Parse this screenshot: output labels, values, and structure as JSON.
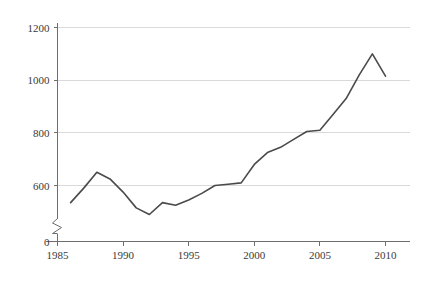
{
  "chart_data": {
    "type": "line",
    "title": "",
    "subtitle": "",
    "xlabel": "",
    "ylabel": "",
    "x": [
      1986,
      1987,
      1988,
      1989,
      1990,
      1991,
      1992,
      1993,
      1994,
      1995,
      1996,
      1997,
      1998,
      1999,
      2000,
      2001,
      2002,
      2003,
      2004,
      2005,
      2006,
      2007,
      2008,
      2009,
      2010
    ],
    "values": [
      535,
      590,
      650,
      625,
      575,
      515,
      490,
      535,
      525,
      545,
      570,
      600,
      605,
      610,
      680,
      725,
      745,
      775,
      805,
      810,
      870,
      930,
      1020,
      1100,
      1015
    ],
    "series": [
      {
        "name": "series-1",
        "values": [
          535,
          590,
          650,
          625,
          575,
          515,
          490,
          535,
          525,
          545,
          570,
          600,
          605,
          610,
          680,
          725,
          745,
          775,
          805,
          810,
          870,
          930,
          1020,
          1100,
          1015
        ],
        "color": "#4a4a4a"
      }
    ],
    "x_ticks": [
      1985,
      1990,
      1995,
      2000,
      2005,
      2010
    ],
    "x_tick_labels": [
      "1985",
      "1990",
      "1995",
      "2000",
      "2005",
      "2010"
    ],
    "y_ticks": [
      0,
      600,
      800,
      1000,
      1200
    ],
    "y_tick_labels": [
      "0",
      "600",
      "800",
      "1000",
      "1200"
    ],
    "y_gridlines": [
      600,
      800,
      1000,
      1200
    ],
    "xlim": [
      1984,
      2011.6
    ],
    "ylim": [
      0,
      1250
    ],
    "y_axis_break": true,
    "y_axis_break_between": [
      0,
      600
    ],
    "grid": true,
    "grid_axis": "y",
    "legend": false,
    "legend_position": "none",
    "annotations": [],
    "colors": {
      "line": "#4a4a4a",
      "grid": "#d9d9d9",
      "axis": "#6e6e6e",
      "tick_text": "#3a3a3a",
      "background": "#ffffff"
    }
  }
}
